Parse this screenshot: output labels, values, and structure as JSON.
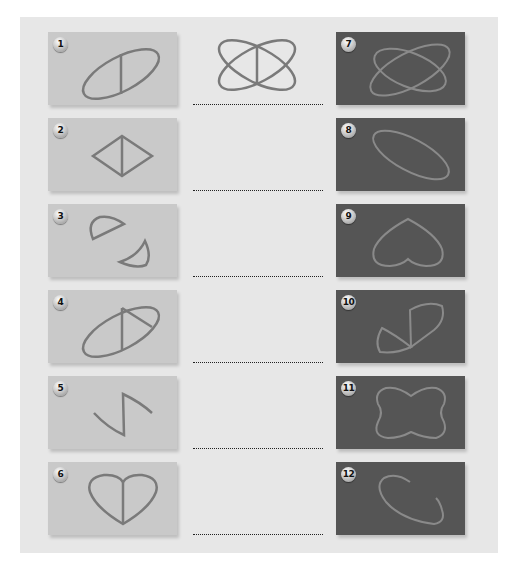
{
  "worksheet": {
    "reference_figure": {
      "shape": "two-crossed-ellipses-with-vertical-line",
      "stroke": "#7a7a7a"
    },
    "left_cards": [
      {
        "number": "1",
        "shape": "tilted-ellipse-with-vertical-chord"
      },
      {
        "number": "2",
        "shape": "diamond-with-vertical-line"
      },
      {
        "number": "3",
        "shape": "two-semicircle-segments"
      },
      {
        "number": "4",
        "shape": "tilted-ellipse-with-two-chords"
      },
      {
        "number": "5",
        "shape": "zigzag-curve"
      },
      {
        "number": "6",
        "shape": "heart-with-vertical-line"
      }
    ],
    "right_cards": [
      {
        "number": "7",
        "shape": "two-crossed-ellipses"
      },
      {
        "number": "8",
        "shape": "tilted-ellipse"
      },
      {
        "number": "9",
        "shape": "inverted-heart"
      },
      {
        "number": "10",
        "shape": "zigzag-with-segments"
      },
      {
        "number": "11",
        "shape": "four-lobed-flower"
      },
      {
        "number": "12",
        "shape": "open-ellipse-arc"
      }
    ],
    "answer_lines_count": 6,
    "colors": {
      "panel": "#e7e7e7",
      "light_card": "#c9c9c9",
      "dark_card": "#555555",
      "light_stroke": "#7a7a7a",
      "dark_stroke": "#8a8a8a"
    }
  }
}
